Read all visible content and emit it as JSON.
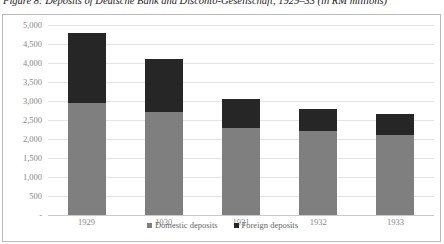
{
  "figure": {
    "caption": "Figure 8: Deposits of Deutsche Bank and Disconto-Gesellschaft, 1929–33 (in RM millions)"
  },
  "chart_data": {
    "type": "bar",
    "stacked": true,
    "title": "Figure 8: Deposits of Deutsche Bank and Disconto-Gesellschaft, 1929–33 (in RM millions)",
    "xlabel": "",
    "ylabel": "",
    "categories": [
      "1929",
      "1930",
      "1931",
      "1932",
      "1933"
    ],
    "series": [
      {
        "name": "Domestic deposits",
        "color": "#7f7f7f",
        "values": [
          2950,
          2700,
          2300,
          2200,
          2100
        ]
      },
      {
        "name": "Foreign deposits",
        "color": "#262626",
        "values": [
          1850,
          1400,
          750,
          600,
          550
        ]
      }
    ],
    "totals": [
      4800,
      4100,
      3050,
      2800,
      2650
    ],
    "ylim": [
      0,
      5000
    ],
    "yticks": [
      0,
      500,
      1000,
      1500,
      2000,
      2500,
      3000,
      3500,
      4000,
      4500,
      5000
    ],
    "ytick_labels": [
      "-",
      "500",
      "1,000",
      "1,500",
      "2,000",
      "2,500",
      "3,000",
      "3,500",
      "4,000",
      "4,500",
      "5,000"
    ],
    "grid": true,
    "legend_position": "bottom",
    "units": "RM millions"
  },
  "legend": {
    "items": [
      {
        "label": "Domestic deposits",
        "color": "#7f7f7f"
      },
      {
        "label": "Foreign deposits",
        "color": "#262626"
      }
    ]
  },
  "colors": {
    "domestic": "#7f7f7f",
    "foreign": "#262626",
    "gridline": "#e4e4e4",
    "frame": "#b9b9b9",
    "tick_text": "#888888"
  }
}
